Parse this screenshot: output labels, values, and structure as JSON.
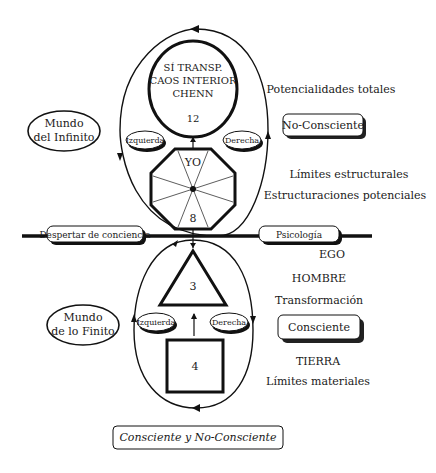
{
  "diagram": {
    "top_circle": {
      "line1": "SÍ TRANSP.",
      "line2": "CAOS INTERIOR",
      "line3": "CHENN",
      "number": "12"
    },
    "octagon": {
      "label": "YO",
      "number": "8"
    },
    "triangle": {
      "number": "3"
    },
    "square": {
      "number": "4"
    },
    "ovals": {
      "infinite_world": {
        "line1": "Mundo",
        "line2": "del Infinito"
      },
      "finite_world": {
        "line1": "Mundo",
        "line2": "de lo Finito"
      },
      "upper_left": "Izquierda",
      "upper_right": "Derecha",
      "lower_left": "Izquierda",
      "lower_right": "Derecha"
    },
    "horizontal_axis": {
      "left_label": "Despertar de conciencia",
      "right_label": "Psicología"
    },
    "right_labels": {
      "potentials": "Potencialidades totales",
      "no_conscious_box": "No-Consciente",
      "structural_limits": "Límites estructurales",
      "potential_structurings": "Estructuraciones potenciales",
      "ego": "EGO",
      "man": "HOMBRE",
      "transformation": "Transformación",
      "conscious_box": "Consciente",
      "earth": "TIERRA",
      "material_limits": "Límites materiales"
    },
    "footer_box": "Consciente y No-Consciente"
  }
}
